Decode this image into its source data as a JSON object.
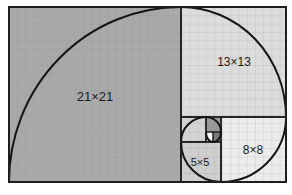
{
  "diagram": {
    "title": "",
    "frame": {
      "x": 9,
      "y": 7,
      "w": 277,
      "h": 175
    },
    "colors": {
      "large_fill": "#a9a9a9",
      "mid_fill": "#d2d2d2",
      "light_fill": "#e8e8e8",
      "small_dark_fill": "#8c8c8c",
      "center_fill": "#ffffff",
      "border": "#1e1e1e",
      "grid": "#8a8a8a",
      "spiral": "#141414"
    },
    "squares": [
      {
        "id": "sq21",
        "label": "21×21",
        "size": 21,
        "x": 9,
        "y": 7,
        "w": 172,
        "h": 175,
        "fill": "#a9a9a9",
        "label_x": 95,
        "label_y": 101,
        "font_size": 13
      },
      {
        "id": "sq13",
        "label": "13×13",
        "size": 13,
        "x": 181,
        "y": 7,
        "w": 105,
        "h": 110,
        "fill": "#dcdcdc",
        "label_x": 234,
        "label_y": 66,
        "font_size": 12
      },
      {
        "id": "sq8",
        "label": "8×8",
        "size": 8,
        "x": 221,
        "y": 117,
        "w": 65,
        "h": 65,
        "fill": "#ececec",
        "label_x": 253,
        "label_y": 154,
        "font_size": 12
      },
      {
        "id": "sq5",
        "label": "5×5",
        "size": 5,
        "x": 181,
        "y": 142,
        "w": 40,
        "h": 40,
        "fill": "#cfcfcf",
        "label_x": 200,
        "label_y": 166,
        "font_size": 11
      },
      {
        "id": "sq3",
        "label": "",
        "size": 3,
        "x": 181,
        "y": 117,
        "w": 25,
        "h": 25,
        "fill": "#d4d4d4",
        "label_x": 0,
        "label_y": 0,
        "font_size": 0
      },
      {
        "id": "sq2",
        "label": "",
        "size": 2,
        "x": 206,
        "y": 117,
        "w": 15,
        "h": 15,
        "fill": "#9a9a9a",
        "label_x": 0,
        "label_y": 0,
        "font_size": 0
      },
      {
        "id": "sq1a",
        "label": "",
        "size": 1,
        "x": 213,
        "y": 132,
        "w": 8,
        "h": 10,
        "fill": "#7a7a7a",
        "label_x": 0,
        "label_y": 0,
        "font_size": 0
      },
      {
        "id": "sq1b",
        "label": "",
        "size": 1,
        "x": 206,
        "y": 132,
        "w": 7,
        "h": 10,
        "fill": "#ffffff",
        "label_x": 0,
        "label_y": 0,
        "font_size": 0
      }
    ],
    "labels": {
      "sq21": "21×21",
      "sq13": "13×13",
      "sq8": "8×8",
      "sq5": "5×5"
    }
  }
}
